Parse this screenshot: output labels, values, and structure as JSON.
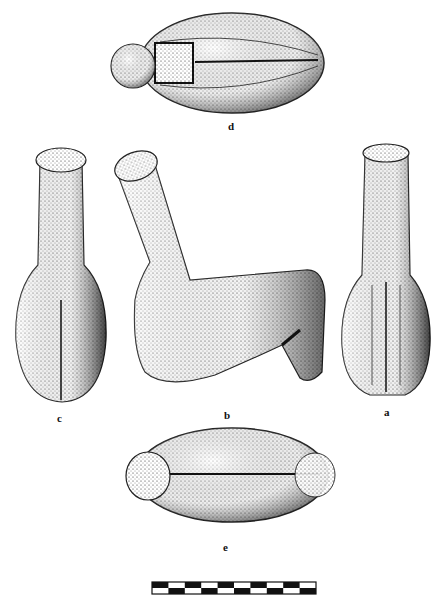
{
  "figure": {
    "views": [
      {
        "id": "d",
        "label": "d",
        "description": "top view"
      },
      {
        "id": "c",
        "label": "c",
        "description": "front view"
      },
      {
        "id": "b",
        "label": "b",
        "description": "side view"
      },
      {
        "id": "a",
        "label": "a",
        "description": "back view"
      },
      {
        "id": "e",
        "label": "e",
        "description": "bottom view"
      }
    ],
    "scale_bar": {
      "segments": 10
    }
  }
}
